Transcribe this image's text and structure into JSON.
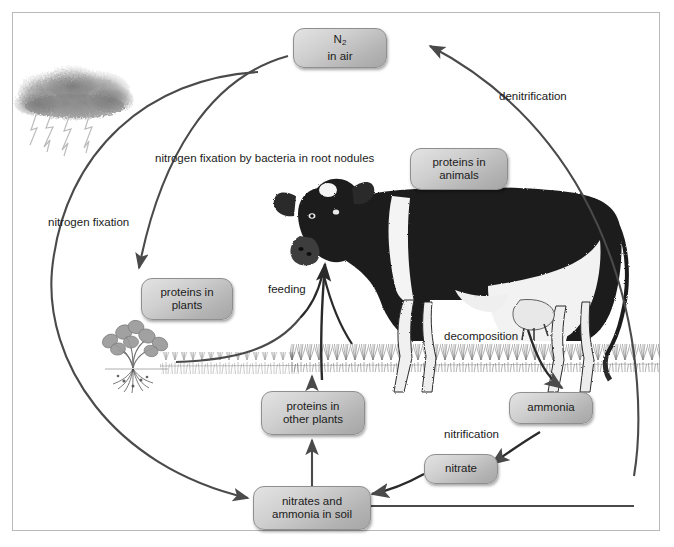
{
  "diagram": {
    "frame_color": "#b9b9b9",
    "arrow_color": "#4a4a4a",
    "node_fill": "#cfcfcf",
    "node_border": "#8f8f8f"
  },
  "nodes": {
    "n2_air": {
      "line1": "N",
      "sub": "2",
      "line2": "in air"
    },
    "proteins_animals": {
      "line1": "proteins in",
      "line2": "animals"
    },
    "proteins_plants": {
      "line1": "proteins in",
      "line2": "plants"
    },
    "proteins_other": {
      "line1": "proteins in",
      "line2": "other plants"
    },
    "ammonia": {
      "line1": "ammonia"
    },
    "nitrate": {
      "line1": "nitrate"
    },
    "nitrates_soil": {
      "line1": "nitrates and",
      "line2": "ammonia in soil"
    }
  },
  "labels": {
    "denitrification": "denitrification",
    "nitrogen_fixation_bacteria": {
      "line1": "nitrogen fixation",
      "line2": "by bacteria in",
      "line3": "root nodules"
    },
    "nitrogen_fixation": {
      "line1": "nitrogen",
      "line2": "fixation"
    },
    "feeding": "feeding",
    "decomposition": "decomposition",
    "nitrification": "nitrification"
  },
  "illustrations": {
    "storm_cloud": "storm-cloud-with-lightning",
    "legume_plant": "clover-plant-with-root-nodules",
    "cow": "dairy-cow-in-grass",
    "grass": "grass-field"
  }
}
